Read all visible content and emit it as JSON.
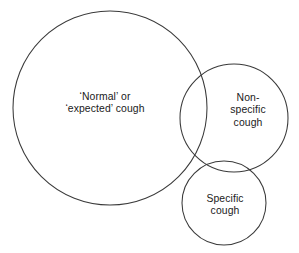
{
  "figure": {
    "type": "venn-diagram",
    "background_color": "#ffffff",
    "stroke_color": "#3a3a3a",
    "text_color": "#1a1a1a"
  },
  "sets": [
    {
      "id": "normal-expected-cough",
      "label": "‘Normal’ or\n‘expected’ cough",
      "label_lines": [
        "‘Normal’ or",
        "‘expected’ cough"
      ],
      "center_x": 110,
      "center_y": 108,
      "radius": 97
    },
    {
      "id": "non-specific-cough",
      "label": "Non-\nspecific\ncough",
      "label_lines": [
        "Non-",
        "specific",
        "cough"
      ],
      "center_x": 234,
      "center_y": 118,
      "radius": 54
    },
    {
      "id": "specific-cough",
      "label": "Specific\ncough",
      "label_lines": [
        "Specific",
        "cough"
      ],
      "center_x": 224,
      "center_y": 203,
      "radius": 42
    }
  ]
}
